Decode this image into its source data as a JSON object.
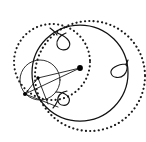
{
  "figure": {
    "canvas": {
      "width": 146,
      "height": 142,
      "background": "#ffffff"
    },
    "colors": {
      "stroke": "#111111",
      "thin_stroke": "#1a1a1a",
      "dotted_stroke": "#1a1a1a",
      "dot_fill": "#000000",
      "background": "#ffffff"
    },
    "elements": {
      "main_circle": {
        "name": "main-circle",
        "type": "circle",
        "cx": 80,
        "cy": 73,
        "r": 48,
        "style": "solid"
      },
      "small_circle": {
        "name": "small-circle",
        "type": "circle",
        "cx": 40,
        "cy": 80,
        "r": 20,
        "style": "thin-solid"
      },
      "dotted_circle_large": {
        "name": "dotted-circle-large",
        "type": "circle",
        "cx": 90,
        "cy": 76,
        "r": 55,
        "style": "dotted"
      },
      "dotted_circle_small": {
        "name": "dotted-circle-small",
        "type": "circle",
        "cx": 52,
        "cy": 62,
        "r": 38,
        "style": "dotted"
      },
      "center_point": {
        "name": "center-point",
        "type": "point",
        "cx": 80,
        "cy": 68,
        "r": 2.9
      },
      "vertex_left_upper": {
        "name": "vertex-left-upper",
        "type": "point",
        "cx": 38,
        "cy": 78,
        "r": 1.7
      },
      "vertex_left_lower": {
        "name": "vertex-left-lower",
        "type": "point",
        "cx": 25,
        "cy": 94,
        "r": 2.0
      },
      "radial_lines": [
        {
          "name": "radial-line-1",
          "x1": 80,
          "y1": 68,
          "x2": 38,
          "y2": 78
        },
        {
          "name": "radial-line-2",
          "x1": 80,
          "y1": 68,
          "x2": 25,
          "y2": 94
        },
        {
          "name": "radial-line-3",
          "x1": 38,
          "y1": 78,
          "x2": 25,
          "y2": 94
        },
        {
          "name": "radial-line-4",
          "x1": 25,
          "y1": 94,
          "x2": 58,
          "y2": 107
        },
        {
          "name": "radial-line-5",
          "x1": 38,
          "y1": 78,
          "x2": 48,
          "y2": 104
        }
      ],
      "loops": [
        {
          "name": "loop-top",
          "path": "M 57 33 C 66 36 72 42 69 47 C 66 52 58 50 57 45 C 56 40 60 35 66 33",
          "position": "top"
        },
        {
          "name": "loop-right",
          "path": "M 126 64 C 117 64 110 69 111 73 C 112 78 120 79 124 75 C 127 72 128 67 126 64",
          "position": "right"
        },
        {
          "name": "loop-bottom",
          "path": "M 56 92 C 65 92 71 97 69 102 C 67 107 59 106 58 101 C 57 96 61 92 67 91",
          "position": "bottom"
        }
      ],
      "connector_curves": [
        {
          "name": "connector-top-loop",
          "path": "M 50 28 C 54 31 56 33 57 35"
        },
        {
          "name": "connector-bottom-loop",
          "path": "M 53 108 C 56 105 57 102 58 100"
        },
        {
          "name": "connector-right-loop",
          "path": "M 128 60 C 127 63 126 64 126 65"
        }
      ]
    }
  }
}
